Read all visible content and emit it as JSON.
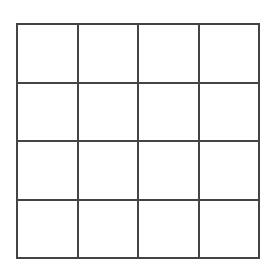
{
  "grid": {
    "rows": 4,
    "cols": 4,
    "line_color": "#444444",
    "cell_color": "#ffffff",
    "cells": [
      [
        "",
        "",
        "",
        ""
      ],
      [
        "",
        "",
        "",
        ""
      ],
      [
        "",
        "",
        "",
        ""
      ],
      [
        "",
        "",
        "",
        ""
      ]
    ]
  }
}
